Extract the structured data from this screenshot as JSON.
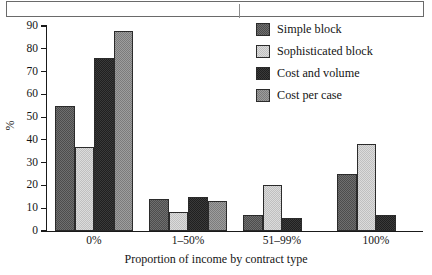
{
  "figure": {
    "caption_box": {
      "present": true
    }
  },
  "chart_data": {
    "type": "bar",
    "title": "",
    "xlabel": "Proportion of income by contract type",
    "ylabel": "%",
    "categories": [
      "0%",
      "1–50%",
      "51–99%",
      "100%"
    ],
    "ylim": [
      0,
      90
    ],
    "ytick_labels": [
      "0",
      "10",
      "20",
      "30",
      "40",
      "50",
      "60",
      "70",
      "80",
      "90"
    ],
    "yticks": [
      0,
      10,
      20,
      30,
      40,
      50,
      60,
      70,
      80,
      90
    ],
    "grid": false,
    "legend_position": "top-right",
    "series": [
      {
        "name": "Simple block",
        "color": "#6f6f6f",
        "values": [
          55,
          14,
          7,
          25
        ]
      },
      {
        "name": "Sophisticated block",
        "color": "#dcdcdc",
        "values": [
          37,
          8.5,
          20,
          38
        ]
      },
      {
        "name": "Cost and volume",
        "color": "#3a3a3a",
        "values": [
          76,
          15,
          5.5,
          7
        ]
      },
      {
        "name": "Cost per case",
        "color": "#9d9d9d",
        "values": [
          88,
          13,
          0,
          0
        ]
      }
    ]
  }
}
